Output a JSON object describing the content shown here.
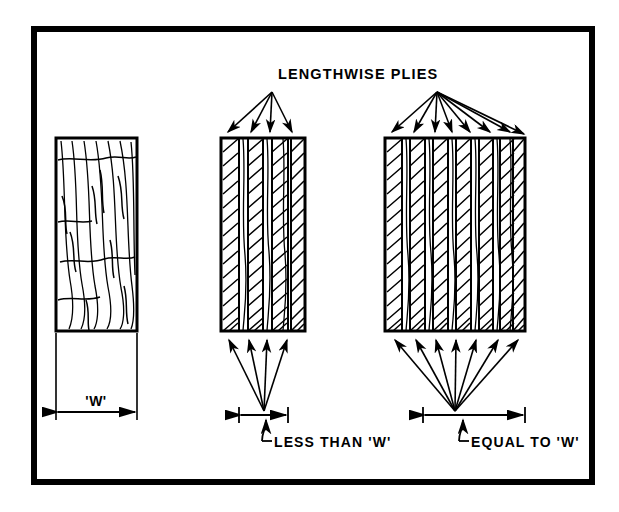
{
  "figure": {
    "name": "lengthwise-plies-comparison-diagram",
    "background_color": "#ffffff",
    "line_color": "#000000",
    "border": {
      "name": "outer-frame",
      "x": 31,
      "y": 26,
      "width": 564,
      "height": 459,
      "stroke_width": 6
    },
    "callout_label": "LENGTHWISE PLIES",
    "labels": {
      "width_label": "'W'",
      "less_than_label": "LESS THAN 'W'",
      "equal_to_label": "EQUAL TO 'W'"
    },
    "panels": [
      {
        "name": "solid-wood-panel",
        "kind": "solid-grain",
        "x": 56,
        "y": 138,
        "width": 81,
        "height": 193,
        "ply_count": 1,
        "dimension": "'W'",
        "description": "solid sawn member with full width grain and seasoning checks"
      },
      {
        "name": "few-plies-panel",
        "kind": "laminated",
        "x": 221,
        "y": 138,
        "width": 84,
        "height": 193,
        "ply_count": 9,
        "arrow_count": 4,
        "dimension": "LESS THAN 'W'",
        "dimension_line": {
          "x1": 239,
          "x2": 288,
          "y": 415
        },
        "apex": {
          "x": 272,
          "y": 92
        },
        "bottom_apex": {
          "x": 264,
          "y": 411
        }
      },
      {
        "name": "many-plies-panel",
        "kind": "laminated",
        "x": 385,
        "y": 138,
        "width": 140,
        "height": 193,
        "ply_count": 16,
        "arrow_count": 8,
        "dimension": "EQUAL TO 'W'",
        "dimension_line": {
          "x1": 423,
          "x2": 525,
          "y": 415
        },
        "apex": {
          "x": 437,
          "y": 92
        },
        "bottom_apex": {
          "x": 455,
          "y": 411
        }
      }
    ],
    "width_dimension": {
      "name": "width-dimension-w",
      "x1": 56,
      "x2": 137,
      "y": 412,
      "extension_top": 333,
      "label": "'W'"
    }
  }
}
